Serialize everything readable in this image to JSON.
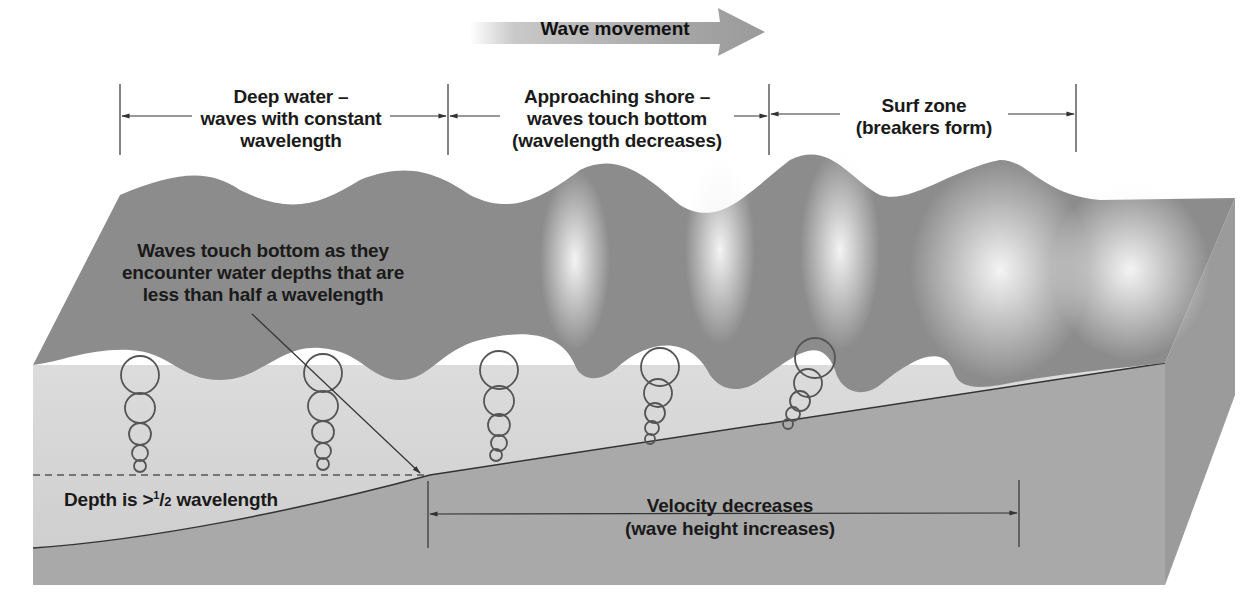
{
  "title": {
    "arrow_label": "Wave movement"
  },
  "zones": [
    {
      "id": "deep",
      "lines": [
        "Deep water –",
        "waves with constant",
        "wavelength"
      ]
    },
    {
      "id": "approach",
      "lines": [
        "Approaching shore –",
        "waves touch bottom",
        "(wavelength decreases)"
      ]
    },
    {
      "id": "surf",
      "lines": [
        "Surf zone",
        "(breakers form)"
      ]
    }
  ],
  "annotations": {
    "touch_bottom": [
      "Waves touch bottom as they",
      "encounter water depths that are",
      "less than half a wavelength"
    ],
    "depth_prefix": "Depth is >",
    "depth_frac_num": "1",
    "depth_frac_den": "2",
    "depth_suffix": " wavelength",
    "velocity": [
      "Velocity decreases",
      "(wave height increases)"
    ]
  },
  "colors": {
    "wave_dark": "#8a8a8a",
    "wave_mid": "#9b9b9b",
    "water_light": "#d6d6d6",
    "seafloor": "#a9a9a9",
    "seafloor_side": "#9a9a9a",
    "foam": "#ececec",
    "line": "#333333"
  }
}
